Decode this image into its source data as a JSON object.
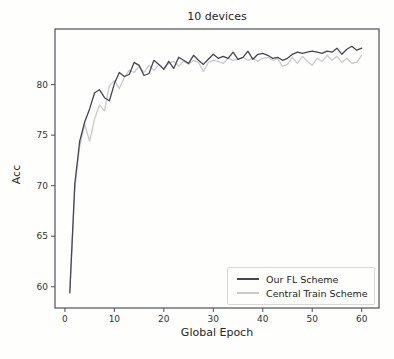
{
  "chart_data": {
    "type": "line",
    "title": "10 devices",
    "xlabel": "Global Epoch",
    "ylabel": "Acc",
    "xlim": [
      -2,
      63.5
    ],
    "ylim": [
      57.9,
      85.5
    ],
    "xticks": [
      0,
      10,
      20,
      30,
      40,
      50,
      60
    ],
    "yticks": [
      60,
      65,
      70,
      75,
      80
    ],
    "grid": false,
    "legend_position": "lower right",
    "axis_color": "#4f5054",
    "x": [
      1,
      2,
      3,
      4,
      5,
      6,
      7,
      8,
      9,
      10,
      11,
      12,
      13,
      14,
      15,
      16,
      17,
      18,
      19,
      20,
      21,
      22,
      23,
      24,
      25,
      26,
      27,
      28,
      29,
      30,
      31,
      32,
      33,
      34,
      35,
      36,
      37,
      38,
      39,
      40,
      41,
      42,
      43,
      44,
      45,
      46,
      47,
      48,
      49,
      50,
      51,
      52,
      53,
      54,
      55,
      56,
      57,
      58,
      59,
      60
    ],
    "series": [
      {
        "name": "Our FL Scheme",
        "color": "#45464f",
        "values": [
          59.4,
          70.2,
          74.4,
          76.3,
          77.6,
          79.2,
          79.5,
          78.7,
          78.4,
          80.1,
          81.2,
          80.8,
          81.0,
          82.2,
          81.9,
          80.9,
          81.1,
          82.4,
          82.0,
          81.5,
          82.3,
          81.6,
          82.7,
          82.4,
          82.1,
          82.9,
          82.4,
          82.0,
          82.5,
          83.0,
          82.6,
          82.8,
          82.6,
          83.2,
          82.5,
          82.7,
          83.3,
          82.5,
          83.0,
          83.1,
          82.9,
          82.6,
          82.7,
          82.4,
          82.6,
          83.0,
          83.2,
          83.1,
          83.2,
          83.3,
          83.2,
          83.1,
          83.3,
          83.2,
          83.6,
          83.0,
          83.5,
          83.8,
          83.4,
          83.6
        ]
      },
      {
        "name": "Central Train Scheme",
        "color": "#c8cacb",
        "values": [
          59.6,
          69.6,
          73.9,
          76.1,
          74.4,
          76.6,
          78.0,
          77.4,
          79.9,
          80.4,
          79.6,
          80.7,
          81.4,
          81.2,
          81.8,
          81.2,
          81.9,
          81.4,
          82.0,
          81.6,
          82.1,
          82.3,
          81.8,
          82.3,
          82.0,
          82.4,
          82.2,
          81.3,
          82.2,
          82.4,
          82.3,
          82.1,
          82.6,
          82.4,
          82.5,
          82.7,
          82.4,
          82.6,
          82.3,
          82.6,
          82.7,
          82.4,
          82.6,
          81.8,
          82.0,
          82.7,
          82.1,
          82.8,
          82.3,
          81.9,
          82.6,
          82.3,
          82.9,
          82.4,
          82.8,
          82.2,
          82.6,
          82.1,
          82.2,
          82.9
        ]
      }
    ]
  }
}
